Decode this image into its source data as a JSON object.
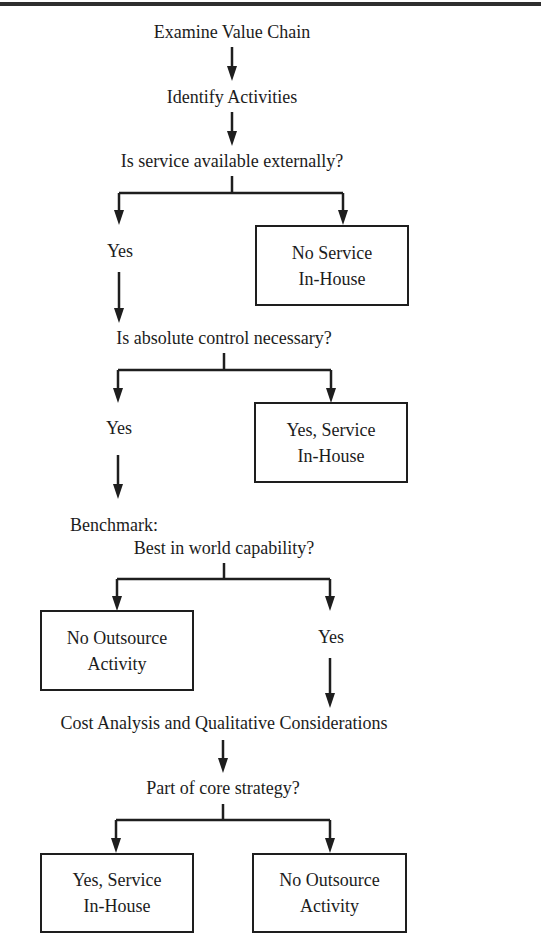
{
  "diagram": {
    "type": "flowchart",
    "title": "",
    "nodes": {
      "examine": "Examine Value Chain",
      "identify": "Identify Activities",
      "q_available": "Is service available externally?",
      "q_available_yes": "Yes",
      "no_service_box": {
        "line1": "No Service",
        "line2": "In-House"
      },
      "q_control": "Is absolute control necessary?",
      "q_control_yes": "Yes",
      "yes_service_box": {
        "line1": "Yes, Service",
        "line2": "In-House"
      },
      "benchmark": "Benchmark:",
      "q_best": "Best in world capability?",
      "no_outsource_box": {
        "line1": "No Outsource",
        "line2": "Activity"
      },
      "q_best_yes": "Yes",
      "cost_analysis": "Cost Analysis and Qualitative Considerations",
      "q_core": "Part of core strategy?",
      "final_yes_box": {
        "line1": "Yes, Service",
        "line2": "In-House"
      },
      "final_no_box": {
        "line1": "No Outsource",
        "line2": "Activity"
      }
    },
    "edges": [
      [
        "Examine Value Chain",
        "Identify Activities"
      ],
      [
        "Identify Activities",
        "Is service available externally?"
      ],
      [
        "Is service available externally?",
        "Yes"
      ],
      [
        "Is service available externally?",
        "No Service In-House"
      ],
      [
        "Yes",
        "Is absolute control necessary?"
      ],
      [
        "Is absolute control necessary?",
        "Yes"
      ],
      [
        "Is absolute control necessary?",
        "Yes, Service In-House"
      ],
      [
        "Yes",
        "Benchmark: Best in world capability?"
      ],
      [
        "Best in world capability?",
        "No Outsource Activity"
      ],
      [
        "Best in world capability?",
        "Yes"
      ],
      [
        "Yes",
        "Cost Analysis and Qualitative Considerations"
      ],
      [
        "Cost Analysis and Qualitative Considerations",
        "Part of core strategy?"
      ],
      [
        "Part of core strategy?",
        "Yes, Service In-House"
      ],
      [
        "Part of core strategy?",
        "No Outsource Activity"
      ]
    ],
    "colors": {
      "line": "#1e1e1e",
      "rule": "#2e2e2e",
      "background": "#ffffff"
    }
  }
}
